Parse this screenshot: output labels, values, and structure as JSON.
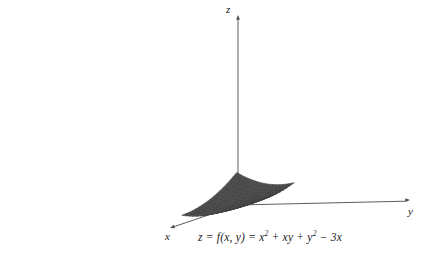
{
  "figure": {
    "title": "",
    "caption": "z = f(x, y) = x² + xy + y² − 3x",
    "axes": {
      "z_label": "z",
      "x_label": "x",
      "y_label": "y"
    },
    "colors": {
      "surface_top": "#9a9a9a",
      "surface_shadow": "#565656",
      "surface_mid": "#7d7d7d",
      "gridline": "#3c3c3c",
      "axis": "#4a4a4a",
      "text": "#1a1a1a",
      "background": "#ffffff"
    }
  },
  "chart_data": {
    "type": "surface",
    "title": "",
    "equation": "z = f(x, y) = x² + xy + y² − 3x",
    "xlabel": "x",
    "ylabel": "y",
    "zlabel": "z",
    "grid": true,
    "legend": "none",
    "xlim": [
      -3.2,
      3.2
    ],
    "ylim": [
      -3.2,
      3.2
    ],
    "zlim": [
      -3,
      22
    ],
    "nx": 17,
    "ny": 17,
    "function": "x*x + x*y + y*y - 3*x",
    "critical_point": {
      "x": 2,
      "y": -1,
      "z": -3,
      "type": "minimum"
    },
    "projection": {
      "origin_px": [
        238,
        205
      ],
      "x_axis_px": [
        -0.33,
        0.115
      ],
      "y_axis_px": [
        0.345,
        -0.012
      ],
      "z_scale_px": 5.2,
      "arrow_x_tip": [
        170,
        228
      ],
      "arrow_y_tip": [
        410,
        200
      ],
      "arrow_z_tip": [
        238,
        15
      ]
    },
    "surface_samples": {
      "x": [
        -3,
        -2.25,
        -1.5,
        -0.75,
        0,
        0.75,
        1.5,
        2.25,
        3
      ],
      "y": [
        -3,
        -2.25,
        -1.5,
        -0.75,
        0,
        0.75,
        1.5,
        2.25,
        3
      ],
      "z": [
        [
          18.0,
          11.8125,
          6.75,
          2.8125,
          0.0,
          -1.6875,
          -2.25,
          -1.6875,
          0.0
        ],
        [
          12.9375,
          8.25,
          4.6875,
          2.25,
          0.9375,
          0.75,
          1.6875,
          3.75,
          6.9375
        ],
        [
          9.0,
          5.8125,
          3.75,
          2.8125,
          3.0,
          4.3125,
          6.75,
          10.3125,
          15.0
        ],
        [
          6.1875,
          4.5,
          3.9375,
          4.5,
          6.1875,
          9.0,
          12.9375,
          18.0,
          24.1875
        ],
        [
          4.5,
          4.3125,
          5.25,
          7.3125,
          10.5,
          14.8125,
          20.25,
          26.8125,
          34.5
        ],
        [
          3.9375,
          5.25,
          7.6875,
          11.25,
          15.9375,
          21.75,
          28.6875,
          36.75,
          45.9375
        ],
        [
          4.5,
          7.3125,
          11.25,
          16.3125,
          22.5,
          29.8125,
          38.25,
          47.8125,
          58.5
        ],
        [
          6.1875,
          10.5,
          15.9375,
          22.5,
          30.1875,
          39.0,
          48.9375,
          60.0,
          72.1875
        ],
        [
          9.0,
          14.8125,
          21.75,
          29.8125,
          39.0,
          49.3125,
          60.75,
          73.3125,
          87.0
        ]
      ]
    }
  }
}
